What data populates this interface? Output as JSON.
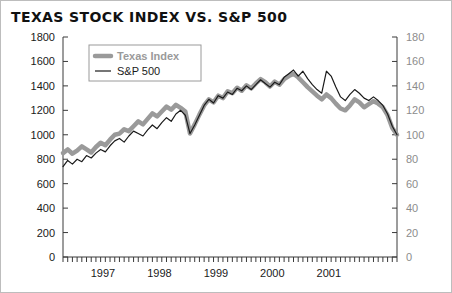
{
  "chart_data": {
    "type": "line",
    "title": "TEXAS STOCK INDEX VS. S&P 500",
    "xlabel": "",
    "ylabel": "",
    "grid": false,
    "legend_position": "top-left",
    "axes": {
      "left": {
        "label": "",
        "min": 0,
        "max": 1800,
        "step": 200,
        "ticks": [
          "0",
          "200",
          "400",
          "600",
          "800",
          "1000",
          "1200",
          "1400",
          "1600",
          "1800"
        ]
      },
      "right": {
        "label": "",
        "min": 0,
        "max": 180,
        "step": 20,
        "ticks": [
          "0",
          "20",
          "40",
          "60",
          "80",
          "100",
          "120",
          "140",
          "160",
          "180"
        ]
      },
      "x": {
        "tick_labels": [
          "1997",
          "1998",
          "1999",
          "2000",
          "2001"
        ],
        "minor_ticks": "monthly",
        "range_start": "1996-10",
        "range_end": "2001-12"
      }
    },
    "series": [
      {
        "name": "Texas Index",
        "axis": "left",
        "color": "#9a9a9a",
        "width": 4.5,
        "values": [
          850,
          880,
          845,
          870,
          905,
          880,
          855,
          900,
          935,
          915,
          960,
          1000,
          1010,
          1045,
          1030,
          1070,
          1110,
          1085,
          1130,
          1175,
          1150,
          1190,
          1230,
          1205,
          1245,
          1220,
          1190,
          1010,
          1085,
          1165,
          1240,
          1290,
          1265,
          1320,
          1300,
          1355,
          1340,
          1385,
          1360,
          1405,
          1380,
          1420,
          1455,
          1430,
          1395,
          1435,
          1410,
          1455,
          1480,
          1500,
          1470,
          1430,
          1390,
          1355,
          1320,
          1290,
          1330,
          1300,
          1255,
          1215,
          1200,
          1240,
          1290,
          1265,
          1225,
          1250,
          1275,
          1255,
          1225,
          1160,
          1055,
          1000
        ]
      },
      {
        "name": "S&P 500",
        "axis": "right",
        "color": "#1a1a1a",
        "width": 1.2,
        "values": [
          74,
          79,
          76,
          80,
          78,
          83,
          81,
          85,
          88,
          86,
          91,
          95,
          97,
          94,
          99,
          103,
          101,
          99,
          104,
          108,
          105,
          110,
          114,
          111,
          117,
          120,
          116,
          101,
          108,
          116,
          124,
          129,
          126,
          132,
          130,
          135,
          133,
          138,
          136,
          140,
          137,
          141,
          145,
          142,
          139,
          143,
          141,
          147,
          150,
          153,
          148,
          152,
          146,
          141,
          137,
          134,
          152,
          148,
          139,
          131,
          128,
          133,
          137,
          134,
          130,
          128,
          131,
          128,
          124,
          117,
          107,
          100
        ]
      }
    ]
  },
  "legend": {
    "items": [
      {
        "label": "Texas Index",
        "style": "thick-gray"
      },
      {
        "label": "S&P 500",
        "style": "thin-black"
      }
    ]
  }
}
